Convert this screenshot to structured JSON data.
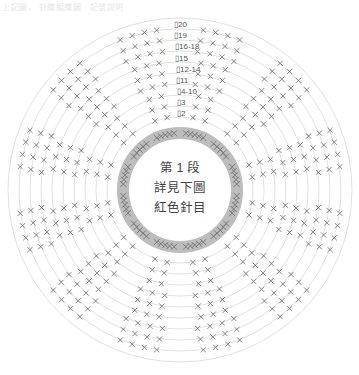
{
  "header": {
    "text": "上記圖。 針織組織圖 · 記號說明"
  },
  "center_label": {
    "line1": "第 1 段",
    "line2": "詳見下圖",
    "line3": "紅色針目"
  },
  "row_labels": [
    {
      "label": "20"
    },
    {
      "label": "19"
    },
    {
      "label": "16-18"
    },
    {
      "label": "15"
    },
    {
      "label": "12-14"
    },
    {
      "label": "11"
    },
    {
      "label": "4-10"
    },
    {
      "label": "3"
    },
    {
      "label": "2"
    }
  ],
  "diagram": {
    "center": [
      180,
      190
    ],
    "inner_band": {
      "r_inner": 51,
      "r_outer": 63,
      "color": "#bdbdbd"
    },
    "ring_radii": [
      73,
      84,
      95,
      106,
      117,
      128,
      139,
      150,
      161,
      172
    ],
    "ring_color": "#d9d9d9",
    "stitch_color": "#6b6b6b"
  }
}
